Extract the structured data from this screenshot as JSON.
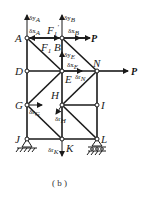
{
  "figure": {
    "caption": "( b )",
    "nodes": {
      "A": "A",
      "B": "B",
      "D": "D",
      "E": "E",
      "N": "N",
      "G": "G",
      "H": "H",
      "I": "I",
      "J": "J",
      "K": "K",
      "L": "L"
    },
    "forces": {
      "P_top": "P",
      "P_right": "P",
      "F1": "F",
      "F1_sub": "1",
      "F1prime": "F",
      "F1prime_sub": "1",
      "F1prime_mark": "′"
    },
    "virtual_displacements": {
      "dyA": "δy",
      "dyA_sub": "A",
      "dxA": "δx",
      "dxA_sub": "A",
      "dyB": "δy",
      "dyB_sub": "B",
      "dxB": "δx",
      "dxB_sub": "B",
      "dyE": "δy",
      "dyE_sub": "E",
      "dxE": "δx",
      "dxE_sub": "E",
      "drN": "δr",
      "drN_sub": "N",
      "drG": "δr",
      "drG_sub": "G",
      "drH": "δr",
      "drH_sub": "H",
      "drK": "δr",
      "drK_sub": "K"
    },
    "colors": {
      "line": "#1a1a1a",
      "background": "#ffffff"
    }
  }
}
